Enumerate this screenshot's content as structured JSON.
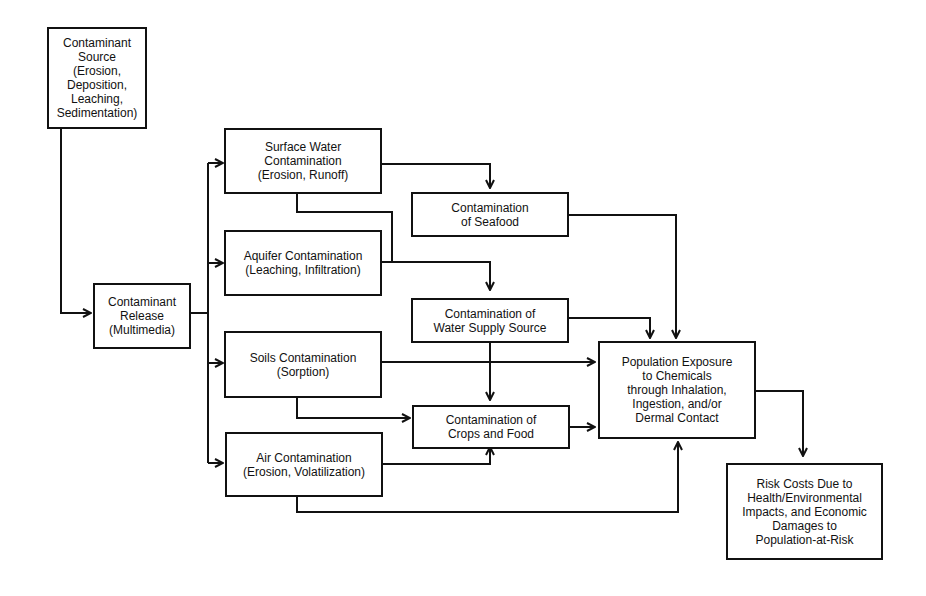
{
  "diagram": {
    "boxes": {
      "source": "Contaminant\nSource\n(Erosion, Deposition,\nLeaching,\nSedimentation)",
      "release": "Contaminant\nRelease\n(Multimedia)",
      "surface_water": "Surface Water\nContamination\n(Erosion, Runoff)",
      "aquifer": "Aquifer Contamination\n(Leaching, Infiltration)",
      "soils": "Soils Contamination\n(Sorption)",
      "air": "Air Contamination\n(Erosion, Volatilization)",
      "seafood": "Contamination\nof Seafood",
      "water_supply": "Contamination of\nWater Supply Source",
      "crops": "Contamination of\nCrops and Food",
      "exposure": "Population Exposure\nto Chemicals\nthrough Inhalation,\nIngestion, and/or\nDermal Contact",
      "risk": "Risk Costs Due to\nHealth/Environmental\nImpacts, and Economic\nDamages to\nPopulation-at-Risk"
    },
    "edges": [
      [
        "source",
        "release"
      ],
      [
        "release",
        "surface_water"
      ],
      [
        "release",
        "aquifer"
      ],
      [
        "release",
        "soils"
      ],
      [
        "release",
        "air"
      ],
      [
        "surface_water",
        "seafood"
      ],
      [
        "surface_water",
        "water_supply"
      ],
      [
        "aquifer",
        "water_supply"
      ],
      [
        "soils",
        "exposure"
      ],
      [
        "soils",
        "crops"
      ],
      [
        "air",
        "crops"
      ],
      [
        "air",
        "exposure"
      ],
      [
        "seafood",
        "exposure"
      ],
      [
        "water_supply",
        "exposure"
      ],
      [
        "water_supply",
        "crops"
      ],
      [
        "crops",
        "exposure"
      ],
      [
        "exposure",
        "risk"
      ]
    ]
  }
}
